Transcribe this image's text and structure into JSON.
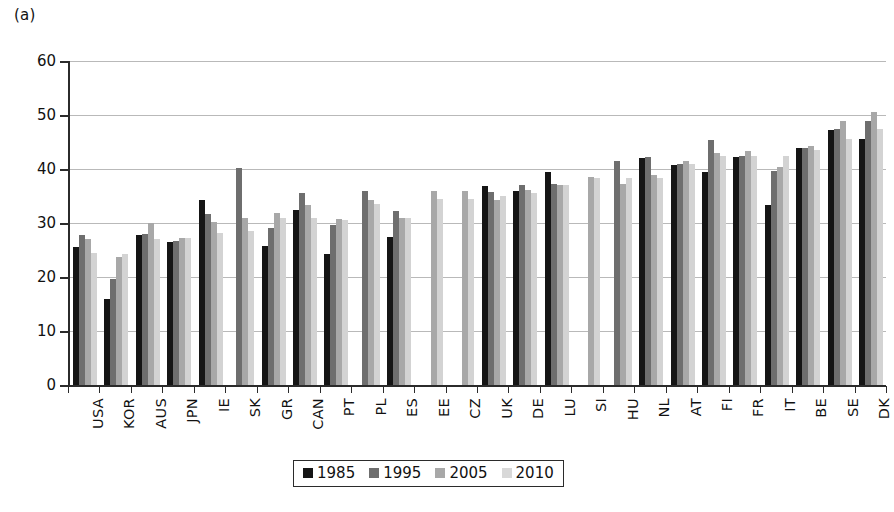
{
  "figure": {
    "panel_label": "(a)"
  },
  "chart_data": {
    "type": "bar",
    "title": "",
    "xlabel": "",
    "ylabel": "",
    "ylim": [
      0,
      60
    ],
    "yticks": [
      0,
      10,
      20,
      30,
      40,
      50,
      60
    ],
    "grid": true,
    "legend_position": "bottom",
    "categories": [
      "USA",
      "KOR",
      "AUS",
      "JPN",
      "IE",
      "SK",
      "GR",
      "CAN",
      "PT",
      "PL",
      "ES",
      "EE",
      "CZ",
      "UK",
      "DE",
      "LU",
      "SI",
      "HU",
      "NL",
      "AT",
      "FI",
      "FR",
      "IT",
      "BE",
      "SE",
      "DK"
    ],
    "series": [
      {
        "name": "1985",
        "color": "#151515",
        "values": [
          25.5,
          16.0,
          27.8,
          26.5,
          34.3,
          null,
          25.8,
          32.5,
          24.3,
          null,
          27.5,
          null,
          null,
          36.8,
          36.0,
          39.5,
          null,
          null,
          42.0,
          40.7,
          39.5,
          42.3,
          33.3,
          43.8,
          47.3,
          45.5
        ]
      },
      {
        "name": "1995",
        "color": "#6e6e6e",
        "values": [
          27.7,
          19.7,
          28.0,
          26.7,
          31.7,
          40.2,
          29.0,
          35.5,
          29.7,
          36.0,
          32.2,
          null,
          null,
          35.8,
          37.0,
          37.3,
          null,
          41.5,
          42.2,
          41.0,
          45.3,
          42.5,
          39.7,
          43.8,
          47.5,
          48.8
        ]
      },
      {
        "name": "2005",
        "color": "#a8a8a8",
        "values": [
          27.0,
          23.7,
          30.0,
          27.2,
          30.2,
          31.0,
          31.8,
          33.4,
          30.8,
          34.3,
          31.0,
          36.0,
          36.0,
          34.3,
          36.2,
          37.0,
          38.5,
          37.2,
          38.8,
          41.5,
          43.0,
          43.3,
          40.3,
          44.2,
          48.8,
          50.5
        ]
      },
      {
        "name": "2010",
        "color": "#d3d3d3",
        "values": [
          24.5,
          24.2,
          27.0,
          27.3,
          28.2,
          28.5,
          31.0,
          31.0,
          30.5,
          33.5,
          31.0,
          34.5,
          34.5,
          35.0,
          35.5,
          37.0,
          38.3,
          38.3,
          38.3,
          41.0,
          42.5,
          42.5,
          42.5,
          43.5,
          45.5,
          47.5
        ]
      }
    ]
  },
  "legend": {
    "items": [
      {
        "label": "1985",
        "color": "#151515"
      },
      {
        "label": "1995",
        "color": "#6e6e6e"
      },
      {
        "label": "2005",
        "color": "#a8a8a8"
      },
      {
        "label": "2010",
        "color": "#d8d8d8"
      }
    ]
  }
}
